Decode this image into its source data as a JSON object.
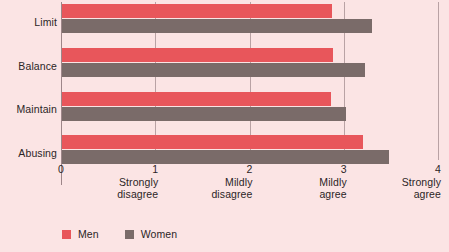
{
  "chart_data": {
    "type": "bar",
    "orientation": "horizontal",
    "title": "",
    "subtitle": "",
    "xlabel": "",
    "ylabel": "",
    "xlim": [
      0,
      4
    ],
    "grid": true,
    "legend_position": "bottom-left",
    "categories": [
      "Limit",
      "Balance",
      "Maintain",
      "Abusing"
    ],
    "series": [
      {
        "name": "Men",
        "color": "#e8565b",
        "values": [
          2.88,
          2.89,
          2.86,
          3.2
        ]
      },
      {
        "name": "Women",
        "color": "#7a6b69",
        "values": [
          3.3,
          3.23,
          3.02,
          3.48
        ]
      }
    ],
    "xticks": [
      {
        "value": 0,
        "num": "0",
        "caption": ""
      },
      {
        "value": 1,
        "num": "1",
        "caption": "Strongly\ndisagree"
      },
      {
        "value": 2,
        "num": "2",
        "caption": "Mildly\ndisagree"
      },
      {
        "value": 3,
        "num": "3",
        "caption": "Mildly\nagree"
      },
      {
        "value": 4,
        "num": "4",
        "caption": "Strongly\nagree"
      }
    ]
  },
  "legend": {
    "items": [
      {
        "label": "Men",
        "color": "#e8565b"
      },
      {
        "label": "Women",
        "color": "#7a6b69"
      }
    ]
  },
  "colors": {
    "background": "#fbe4e4",
    "men": "#e8565b",
    "women": "#7a6b69",
    "gridline": "#b9a2a4",
    "axis": "#9d8689",
    "text": "#2b2526"
  }
}
